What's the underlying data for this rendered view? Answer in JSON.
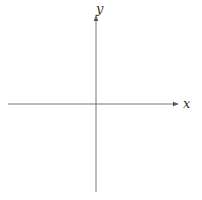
{
  "diagram": {
    "title": "",
    "type": "coordinate-axes",
    "x_axis": {
      "label": "x"
    },
    "y_axis": {
      "label": "y"
    },
    "colors": {
      "axis": "#666666",
      "label": "#333333",
      "background": "#ffffff"
    }
  }
}
